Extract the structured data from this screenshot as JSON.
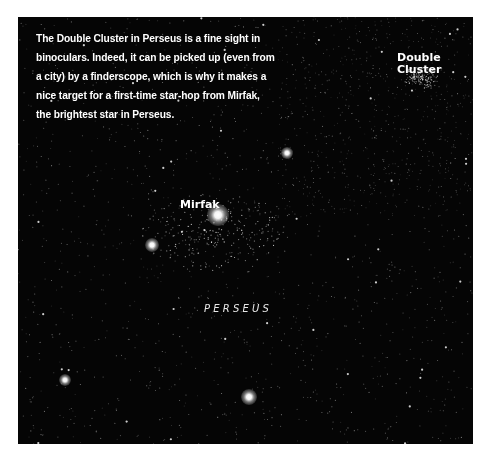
{
  "caption": {
    "lines": [
      "The Double Cluster in Perseus is a fine sight in",
      "binoculars. Indeed, it can be picked up (even from",
      "a city) by a finderscope, which is why it makes a",
      "nice target for a first-time star-hop from Mirfak,",
      "the brightest star in Perseus."
    ]
  },
  "labels": {
    "mirfak": "Mirfak",
    "double_cluster_line1": "Double",
    "double_cluster_line2": "Cluster",
    "constellation": "PERSEUS"
  },
  "colors": {
    "sky": "#050505",
    "text": "#ffffff",
    "page": "#ffffff"
  },
  "bright_stars": [
    {
      "name": "mirfak",
      "x": 200,
      "y": 198,
      "size": 22
    },
    {
      "name": "star-left",
      "x": 134,
      "y": 228,
      "size": 14
    },
    {
      "name": "star-upper-mid",
      "x": 269,
      "y": 136,
      "size": 12
    },
    {
      "name": "star-lower-mid",
      "x": 231,
      "y": 380,
      "size": 16
    },
    {
      "name": "star-lower-left",
      "x": 47,
      "y": 363,
      "size": 12
    }
  ]
}
